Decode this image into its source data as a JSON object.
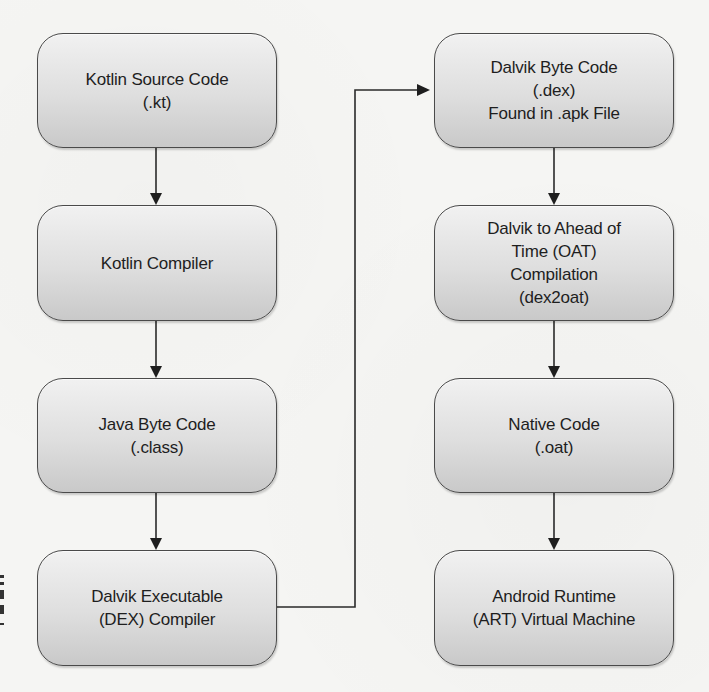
{
  "diagram": {
    "type": "flowchart",
    "colors": {
      "background": "#f5f5f3",
      "box_fill_top": "#f1f1f1",
      "box_fill_bottom": "#c9c9c9",
      "box_border": "#4a4a4a",
      "text": "#1e1e1e",
      "edge": "#2a2a2a"
    },
    "nodes": [
      {
        "id": "kotlin-source",
        "lines": [
          "Kotlin Source Code",
          "(.kt)"
        ]
      },
      {
        "id": "kotlin-compiler",
        "lines": [
          "Kotlin Compiler"
        ]
      },
      {
        "id": "java-bytecode",
        "lines": [
          "Java Byte Code",
          "(.class)"
        ]
      },
      {
        "id": "dex-compiler",
        "lines": [
          "Dalvik Executable",
          "(DEX) Compiler"
        ]
      },
      {
        "id": "dalvik-bytecode",
        "lines": [
          "Dalvik Byte Code",
          "(.dex)",
          "Found in .apk File"
        ]
      },
      {
        "id": "dex2oat",
        "lines": [
          "Dalvik to Ahead of",
          "Time (OAT)",
          "Compilation",
          "(dex2oat)"
        ]
      },
      {
        "id": "native-code",
        "lines": [
          "Native Code",
          "(.oat)"
        ]
      },
      {
        "id": "art-vm",
        "lines": [
          "Android Runtime",
          "(ART) Virtual Machine"
        ]
      }
    ],
    "edges": [
      {
        "from": "kotlin-source",
        "to": "kotlin-compiler"
      },
      {
        "from": "kotlin-compiler",
        "to": "java-bytecode"
      },
      {
        "from": "java-bytecode",
        "to": "dex-compiler"
      },
      {
        "from": "dex-compiler",
        "to": "dalvik-bytecode"
      },
      {
        "from": "dalvik-bytecode",
        "to": "dex2oat"
      },
      {
        "from": "dex2oat",
        "to": "native-code"
      },
      {
        "from": "native-code",
        "to": "art-vm"
      }
    ]
  }
}
